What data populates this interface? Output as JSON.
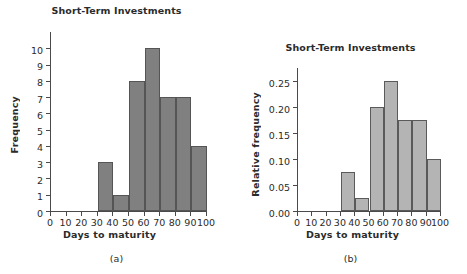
{
  "figure": {
    "panels": [
      {
        "id": "a",
        "panel_label": "(a)",
        "title": "Short-Term Investments",
        "ylabel": "Frequency",
        "xlabel": "Days to maturity"
      },
      {
        "id": "b",
        "panel_label": "(b)",
        "title": "Short-Term Investments",
        "ylabel": "Relative frequency",
        "xlabel": "Days to maturity"
      }
    ]
  },
  "chart_data": [
    {
      "type": "bar",
      "title": "Short-Term Investments",
      "xlabel": "Days to maturity",
      "ylabel": "Frequency",
      "panel": "(a)",
      "bin_edges": [
        0,
        10,
        20,
        30,
        40,
        50,
        60,
        70,
        80,
        90,
        100
      ],
      "categories": [
        "0-10",
        "10-20",
        "20-30",
        "30-40",
        "40-50",
        "50-60",
        "60-70",
        "70-80",
        "80-90",
        "90-100"
      ],
      "values": [
        0,
        0,
        0,
        3,
        1,
        8,
        10,
        7,
        7,
        4
      ],
      "xlim": [
        0,
        100
      ],
      "ylim": [
        0,
        11
      ],
      "xticks": [
        0,
        10,
        20,
        30,
        40,
        50,
        60,
        70,
        80,
        90,
        100
      ],
      "xtick_labels": [
        "0",
        "10",
        "20",
        "30",
        "40",
        "50",
        "60",
        "70",
        "80",
        "90",
        "100"
      ],
      "yticks": [
        0,
        1,
        2,
        3,
        4,
        5,
        6,
        7,
        8,
        9,
        10
      ],
      "ytick_labels": [
        "0",
        "1",
        "2",
        "3",
        "4",
        "5",
        "6",
        "7",
        "8",
        "9",
        "10"
      ],
      "grid": false,
      "legend": "none",
      "bar_color": "#808080",
      "bar_edge_color": "#555555"
    },
    {
      "type": "bar",
      "title": "Short-Term Investments",
      "xlabel": "Days to maturity",
      "ylabel": "Relative frequency",
      "panel": "(b)",
      "bin_edges": [
        0,
        10,
        20,
        30,
        40,
        50,
        60,
        70,
        80,
        90,
        100
      ],
      "categories": [
        "0-10",
        "10-20",
        "20-30",
        "30-40",
        "40-50",
        "50-60",
        "60-70",
        "70-80",
        "80-90",
        "90-100"
      ],
      "values": [
        0,
        0,
        0,
        0.075,
        0.025,
        0.2,
        0.25,
        0.175,
        0.175,
        0.1
      ],
      "xlim": [
        0,
        100
      ],
      "ylim": [
        0,
        0.275
      ],
      "xticks": [
        0,
        10,
        20,
        30,
        40,
        50,
        60,
        70,
        80,
        90,
        100
      ],
      "xtick_labels": [
        "0",
        "10",
        "20",
        "30",
        "40",
        "50",
        "60",
        "70",
        "80",
        "90",
        "100"
      ],
      "yticks": [
        0.0,
        0.05,
        0.1,
        0.15,
        0.2,
        0.25
      ],
      "ytick_labels": [
        "0.00",
        "0.05",
        "0.10",
        "0.15",
        "0.20",
        "0.25"
      ],
      "grid": false,
      "legend": "none",
      "bar_color": "#b4b4b4",
      "bar_edge_color": "#5a5a5a"
    }
  ]
}
